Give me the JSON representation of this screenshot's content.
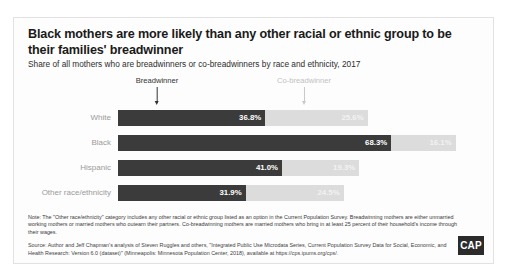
{
  "title": "Black mothers are more likely than any other racial or ethnic group to be their families' breadwinner",
  "subtitle": "Share of all mothers who are breadwinners or co-breadwinners by race and ethnicity, 2017",
  "legend": {
    "breadwinner": "Breadwinner",
    "cobreadwinner": "Co-breadwinner"
  },
  "footer": {
    "note": "Note: The \"Other race/ethnicity\" category includes any other racial or ethnic group listed as an option in the Current Population Survey. Breadwinning mothers are either unmarried working mothers or married mothers who outearn their partners. Co-breadwinning mothers are married mothers who bring in at least 25 percent of their household's income through their wages.",
    "source": "Source: Author and Jeff Chapman's analysis of Steven Ruggles and others, \"Integrated Public Use Microdata Series, Current Population Survey Data for Social, Economic, and Health Research: Version 6.0 (dataset)\" (Minneapolis: Minnesota Population Center, 2018), available at https://cps.ipums.org/cps/."
  },
  "logo": "CAP",
  "chart_data": {
    "type": "bar",
    "orientation": "horizontal",
    "stacked": true,
    "title": "Black mothers are more likely than any other racial or ethnic group to be their families' breadwinner",
    "subtitle": "Share of all mothers who are breadwinners or co-breadwinners by race and ethnicity, 2017",
    "xlabel": "",
    "ylabel": "",
    "xlim": [
      0,
      90
    ],
    "grid": false,
    "legend_position": "top",
    "categories": [
      "White",
      "Black",
      "Hispanic",
      "Other race/ethnicity"
    ],
    "series": [
      {
        "name": "Breadwinner",
        "color": "#3b3b3b",
        "values": [
          36.8,
          68.3,
          41.0,
          31.9
        ],
        "labels": [
          "36.8%",
          "68.3%",
          "41.0%",
          "31.9%"
        ]
      },
      {
        "name": "Co-breadwinner",
        "color": "#dcdcdc",
        "values": [
          25.6,
          16.1,
          19.3,
          24.5
        ],
        "labels": [
          "25.6%",
          "16.1%",
          "19.3%",
          "24.5%"
        ]
      }
    ],
    "totals": [
      62.4,
      84.4,
      60.3,
      56.4
    ]
  }
}
